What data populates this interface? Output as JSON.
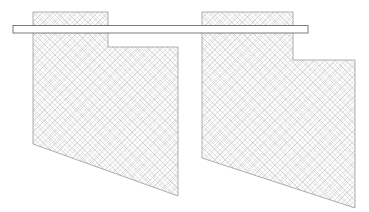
{
  "drawing": {
    "title": "Sectioned Bracket Pair With Through Rail",
    "canvas": {
      "width": 369,
      "height": 212,
      "background": "#ffffff"
    },
    "style": {
      "outline_color": "#8c8c8c",
      "outline_width": 0.7,
      "hatch_color": "#c9c9c9",
      "hatch_width": 0.45,
      "hatch_spacing": 5,
      "hatch_angles": [
        45,
        -45
      ],
      "section_fill": "#fdfdfd",
      "rail_outline_color": "#5a5a5a",
      "rail_fill": "#ffffff",
      "rail_outline_width": 0.8
    },
    "parts": [
      {
        "name": "left-sectioned-part",
        "label": "Left hatched section profile",
        "fill": "#fdfdfd",
        "stroke": "#8c8c8c",
        "points": "33,12 108,12 108,47 178,47 178,196 33,144"
      },
      {
        "name": "right-sectioned-part",
        "label": "Right hatched section profile",
        "fill": "#fdfdfd",
        "stroke": "#8c8c8c",
        "points": "202,12 293,12 293,60 355,60 355,208 202,158"
      }
    ],
    "rail": {
      "name": "through-rail-bar",
      "label": "Horizontal through rail",
      "x": 13,
      "y": 25.5,
      "width": 295,
      "height": 7.5,
      "fill": "#ffffff",
      "stroke": "#5a5a5a"
    }
  }
}
